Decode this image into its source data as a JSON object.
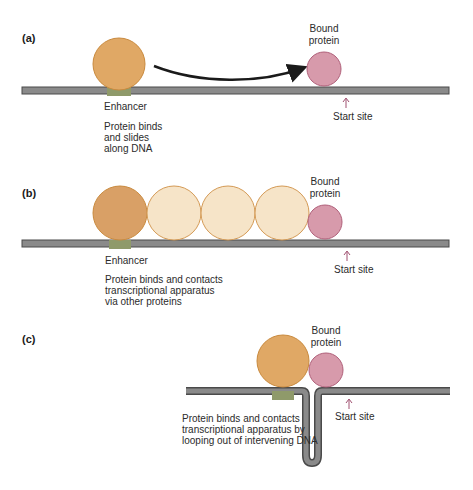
{
  "colors": {
    "dna_fill": "#8a8a8a",
    "dna_edge": "#4a4a4a",
    "enhancer": "#8f9a6a",
    "activator_fill": "#e0a865",
    "activator_edge": "#c98a3e",
    "spacer_fill": "#f6e4c8",
    "spacer_edge": "#d49a55",
    "bound_fill": "#d79aab",
    "bound_edge": "#b0607a",
    "start_arrow": "#a05070",
    "curve_arrow": "#1a1a1a"
  },
  "panels": [
    {
      "id": "a",
      "label": "(a)",
      "enhancer_label": "Enhancer",
      "bound_label_line1": "Bound",
      "bound_label_line2": "protein",
      "start_label": "Start site",
      "caption": [
        "Protein binds",
        "and slides",
        "along DNA"
      ]
    },
    {
      "id": "b",
      "label": "(b)",
      "enhancer_label": "Enhancer",
      "bound_label_line1": "Bound",
      "bound_label_line2": "protein",
      "start_label": "Start site",
      "caption": [
        "Protein binds and contacts",
        "transcriptional apparatus",
        "via other proteins"
      ]
    },
    {
      "id": "c",
      "label": "(c)",
      "bound_label_line1": "Bound",
      "bound_label_line2": "protein",
      "start_label": "Start site",
      "caption": [
        "Protein binds and contacts",
        "transcriptional apparatus by",
        "looping out of intervening DNA"
      ]
    }
  ]
}
